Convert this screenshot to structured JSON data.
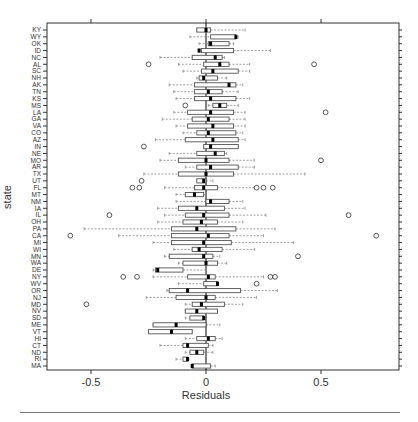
{
  "chart_data": {
    "type": "boxplot",
    "title": "",
    "xlabel": "Residuals",
    "ylabel": "state",
    "xlim": [
      -0.69,
      0.84
    ],
    "xticks": [
      -0.5,
      0,
      0.5
    ],
    "xtick_labels": [
      "-0.5",
      "0",
      "0.5"
    ],
    "reference_line": 0,
    "grid": false,
    "legend": null,
    "categories": [
      "KY",
      "WY",
      "OK",
      "ID",
      "NC",
      "AL",
      "SC",
      "NH",
      "AK",
      "TN",
      "KS",
      "MS",
      "LA",
      "GA",
      "VA",
      "CO",
      "AZ",
      "IN",
      "NE",
      "MO",
      "AR",
      "TX",
      "UT",
      "FL",
      "MT",
      "NM",
      "IA",
      "IL",
      "OH",
      "PA",
      "CA",
      "MI",
      "WI",
      "MN",
      "WA",
      "DE",
      "NY",
      "WV",
      "OR",
      "NJ",
      "MD",
      "NV",
      "SD",
      "ME",
      "VT",
      "HI",
      "CT",
      "ND",
      "RI",
      "MA"
    ],
    "boxes": [
      {
        "state": "KY",
        "whislo": -0.04,
        "q1": -0.04,
        "med": 0.0,
        "q3": 0.02,
        "whishi": 0.17,
        "fliers": []
      },
      {
        "state": "WY",
        "whislo": -0.07,
        "q1": 0.02,
        "med": 0.13,
        "q3": 0.13,
        "whishi": 0.14,
        "fliers": []
      },
      {
        "state": "OK",
        "whislo": -0.03,
        "q1": 0.01,
        "med": 0.02,
        "q3": 0.1,
        "whishi": 0.12,
        "fliers": []
      },
      {
        "state": "ID",
        "whislo": -0.02,
        "q1": -0.02,
        "med": -0.03,
        "q3": 0.12,
        "whishi": 0.28,
        "fliers": []
      },
      {
        "state": "NC",
        "whislo": -0.2,
        "q1": -0.06,
        "med": 0.04,
        "q3": 0.07,
        "whishi": 0.08,
        "fliers": []
      },
      {
        "state": "AL",
        "whislo": -0.12,
        "q1": -0.01,
        "med": 0.06,
        "q3": 0.1,
        "whishi": 0.19,
        "fliers": [
          -0.25,
          0.47
        ]
      },
      {
        "state": "SC",
        "whislo": -0.1,
        "q1": -0.02,
        "med": 0.03,
        "q3": 0.14,
        "whishi": 0.19,
        "fliers": []
      },
      {
        "state": "NH",
        "whislo": -0.04,
        "q1": -0.03,
        "med": -0.01,
        "q3": 0.05,
        "whishi": 0.09,
        "fliers": []
      },
      {
        "state": "AK",
        "whislo": -0.16,
        "q1": -0.05,
        "med": 0.1,
        "q3": 0.13,
        "whishi": 0.16,
        "fliers": []
      },
      {
        "state": "TN",
        "whislo": -0.14,
        "q1": -0.05,
        "med": 0.01,
        "q3": 0.07,
        "whishi": 0.14,
        "fliers": []
      },
      {
        "state": "KS",
        "whislo": -0.13,
        "q1": -0.05,
        "med": 0.02,
        "q3": 0.13,
        "whishi": 0.19,
        "fliers": []
      },
      {
        "state": "MS",
        "whislo": 0.01,
        "q1": 0.03,
        "med": 0.06,
        "q3": 0.09,
        "whishi": 0.14,
        "fliers": [
          -0.09
        ]
      },
      {
        "state": "LA",
        "whislo": -0.14,
        "q1": -0.08,
        "med": 0.02,
        "q3": 0.12,
        "whishi": 0.17,
        "fliers": [
          0.52
        ]
      },
      {
        "state": "GA",
        "whislo": -0.19,
        "q1": -0.06,
        "med": 0.01,
        "q3": 0.1,
        "whishi": 0.17,
        "fliers": []
      },
      {
        "state": "VA",
        "whislo": -0.13,
        "q1": -0.08,
        "med": 0.03,
        "q3": 0.12,
        "whishi": 0.17,
        "fliers": []
      },
      {
        "state": "CO",
        "whislo": -0.1,
        "q1": -0.04,
        "med": 0.01,
        "q3": 0.13,
        "whishi": 0.16,
        "fliers": []
      },
      {
        "state": "AZ",
        "whislo": -0.22,
        "q1": -0.09,
        "med": 0.03,
        "q3": 0.14,
        "whishi": 0.17,
        "fliers": []
      },
      {
        "state": "IN",
        "whislo": -0.01,
        "q1": -0.01,
        "med": 0.02,
        "q3": 0.14,
        "whishi": 0.14,
        "fliers": [
          -0.27
        ]
      },
      {
        "state": "NE",
        "whislo": -0.16,
        "q1": -0.04,
        "med": 0.04,
        "q3": 0.08,
        "whishi": 0.09,
        "fliers": []
      },
      {
        "state": "MO",
        "whislo": -0.2,
        "q1": -0.12,
        "med": 0.0,
        "q3": 0.1,
        "whishi": 0.21,
        "fliers": [
          0.5
        ]
      },
      {
        "state": "AR",
        "whislo": -0.09,
        "q1": -0.04,
        "med": 0.02,
        "q3": 0.14,
        "whishi": 0.21,
        "fliers": []
      },
      {
        "state": "TX",
        "whislo": -0.27,
        "q1": -0.12,
        "med": 0.0,
        "q3": 0.12,
        "whishi": 0.43,
        "fliers": []
      },
      {
        "state": "UT",
        "whislo": -0.02,
        "q1": -0.04,
        "med": -0.01,
        "q3": 0.0,
        "whishi": 0.03,
        "fliers": [
          -0.28
        ]
      },
      {
        "state": "FL",
        "whislo": -0.18,
        "q1": -0.05,
        "med": -0.01,
        "q3": 0.05,
        "whishi": 0.21,
        "fliers": [
          -0.32,
          -0.29,
          0.22,
          0.25,
          0.29
        ]
      },
      {
        "state": "MT",
        "whislo": -0.13,
        "q1": -0.09,
        "med": -0.05,
        "q3": -0.01,
        "whishi": 0.0,
        "fliers": []
      },
      {
        "state": "NM",
        "whislo": -0.13,
        "q1": 0.0,
        "med": 0.02,
        "q3": 0.1,
        "whishi": 0.16,
        "fliers": []
      },
      {
        "state": "IA",
        "whislo": -0.21,
        "q1": -0.12,
        "med": -0.04,
        "q3": 0.08,
        "whishi": 0.17,
        "fliers": []
      },
      {
        "state": "IL",
        "whislo": -0.18,
        "q1": -0.09,
        "med": -0.01,
        "q3": 0.1,
        "whishi": 0.26,
        "fliers": [
          -0.42,
          0.62
        ]
      },
      {
        "state": "OH",
        "whislo": -0.21,
        "q1": -0.1,
        "med": -0.02,
        "q3": 0.05,
        "whishi": 0.16,
        "fliers": []
      },
      {
        "state": "PA",
        "whislo": -0.53,
        "q1": -0.15,
        "med": -0.04,
        "q3": 0.13,
        "whishi": 0.3,
        "fliers": []
      },
      {
        "state": "CA",
        "whislo": -0.38,
        "q1": -0.15,
        "med": 0.01,
        "q3": 0.1,
        "whishi": 0.25,
        "fliers": [
          -0.59,
          0.74
        ]
      },
      {
        "state": "MI",
        "whislo": -0.23,
        "q1": -0.15,
        "med": -0.01,
        "q3": 0.11,
        "whishi": 0.38,
        "fliers": []
      },
      {
        "state": "WI",
        "whislo": -0.14,
        "q1": -0.06,
        "med": -0.03,
        "q3": 0.07,
        "whishi": 0.21,
        "fliers": []
      },
      {
        "state": "MN",
        "whislo": -0.18,
        "q1": -0.16,
        "med": -0.01,
        "q3": 0.03,
        "whishi": 0.06,
        "fliers": [
          0.4
        ]
      },
      {
        "state": "WA",
        "whislo": -0.12,
        "q1": -0.1,
        "med": 0.0,
        "q3": 0.05,
        "whishi": 0.09,
        "fliers": []
      },
      {
        "state": "DE",
        "whislo": -0.23,
        "q1": -0.22,
        "med": -0.21,
        "q3": -0.1,
        "whishi": 0.0,
        "fliers": []
      },
      {
        "state": "NY",
        "whislo": -0.23,
        "q1": -0.08,
        "med": 0.01,
        "q3": 0.04,
        "whishi": 0.25,
        "fliers": [
          -0.36,
          -0.3,
          0.28,
          0.3
        ]
      },
      {
        "state": "WV",
        "whislo": -0.12,
        "q1": -0.01,
        "med": 0.05,
        "q3": 0.05,
        "whishi": 0.05,
        "fliers": [
          0.22
        ]
      },
      {
        "state": "OR",
        "whislo": -0.17,
        "q1": -0.16,
        "med": -0.08,
        "q3": 0.15,
        "whishi": 0.31,
        "fliers": []
      },
      {
        "state": "NJ",
        "whislo": -0.26,
        "q1": -0.13,
        "med": 0.0,
        "q3": 0.04,
        "whishi": 0.22,
        "fliers": []
      },
      {
        "state": "MD",
        "whislo": -0.09,
        "q1": -0.06,
        "med": -0.02,
        "q3": 0.08,
        "whishi": 0.16,
        "fliers": [
          -0.52
        ]
      },
      {
        "state": "NV",
        "whislo": -0.09,
        "q1": -0.09,
        "med": -0.04,
        "q3": 0.05,
        "whishi": 0.05,
        "fliers": []
      },
      {
        "state": "SD",
        "whislo": -0.09,
        "q1": -0.07,
        "med": -0.01,
        "q3": -0.01,
        "whishi": -0.01,
        "fliers": []
      },
      {
        "state": "ME",
        "whislo": -0.23,
        "q1": -0.23,
        "med": -0.13,
        "q3": 0.0,
        "whishi": 0.06,
        "fliers": []
      },
      {
        "state": "VT",
        "whislo": -0.25,
        "q1": -0.25,
        "med": -0.15,
        "q3": -0.06,
        "whishi": -0.06,
        "fliers": []
      },
      {
        "state": "HI",
        "whislo": -0.09,
        "q1": -0.04,
        "med": 0.01,
        "q3": 0.04,
        "whishi": 0.07,
        "fliers": []
      },
      {
        "state": "CT",
        "whislo": -0.2,
        "q1": -0.1,
        "med": -0.08,
        "q3": 0.01,
        "whishi": 0.03,
        "fliers": []
      },
      {
        "state": "ND",
        "whislo": -0.09,
        "q1": -0.07,
        "med": -0.04,
        "q3": -0.01,
        "whishi": 0.03,
        "fliers": []
      },
      {
        "state": "RI",
        "whislo": -0.13,
        "q1": -0.1,
        "med": -0.08,
        "q3": -0.08,
        "whishi": -0.08,
        "fliers": []
      },
      {
        "state": "MA",
        "whislo": -0.06,
        "q1": -0.06,
        "med": -0.06,
        "q3": 0.02,
        "whishi": 0.04,
        "fliers": []
      }
    ]
  },
  "colors": {
    "axis": "#333333",
    "box": "#555555",
    "whisker": "#777777",
    "median": "#000000",
    "text": "#333333"
  }
}
